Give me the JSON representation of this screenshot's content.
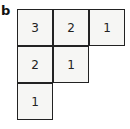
{
  "figure": {
    "panel_label": "b",
    "diagram_type": "young-tableau",
    "rows": [
      [
        "3",
        "2",
        "1"
      ],
      [
        "2",
        "1"
      ],
      [
        "1"
      ]
    ]
  }
}
